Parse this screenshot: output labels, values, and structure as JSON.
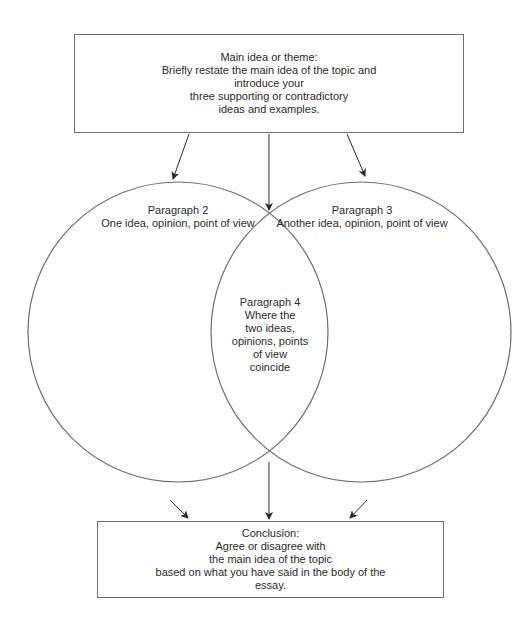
{
  "diagram": {
    "title_box": {
      "lines": [
        "Main idea or theme:",
        "Briefly restate the main idea of the topic and",
        "introduce your",
        "three supporting or contradictory",
        "ideas and examples."
      ]
    },
    "circle_left": {
      "lines": [
        "Paragraph 2",
        "One idea, opinion, point of view"
      ]
    },
    "circle_right": {
      "lines": [
        "Paragraph 3",
        "Another idea, opinion, point of view"
      ]
    },
    "overlap": {
      "lines": [
        "Paragraph 4",
        "Where the",
        "two ideas,",
        "opinions, points",
        "of view",
        "coincide"
      ]
    },
    "conclusion_box": {
      "lines": [
        "Conclusion:",
        "Agree or disagree with",
        "the main idea of the topic",
        "based on what you have said in the body of the",
        "essay."
      ]
    },
    "colors": {
      "stroke": "#6e6e6e",
      "arrow": "#2a2a2a",
      "text": "#2a2a2a",
      "background": "#ffffff"
    }
  }
}
